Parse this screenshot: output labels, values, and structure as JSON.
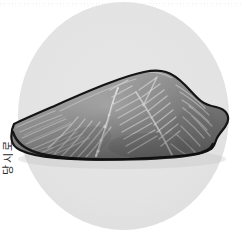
{
  "page": {
    "background_color": "#ffffff",
    "width": 243,
    "height": 238
  },
  "top_rule": {
    "style": "dotted",
    "color": "#ededed"
  },
  "plate": {
    "shape": "circle",
    "color": "#e3e3e3",
    "label": "circular light gray backdrop"
  },
  "margin_caption": {
    "text": "당시로",
    "orientation": "rotated-90",
    "color": "#2b2b2b"
  },
  "illustration": {
    "subject": "fish-fillet",
    "title": "생선 필레",
    "style": "grayscale pencil illustration",
    "outline_color": "#141414",
    "flesh_light": "#b4b4b4",
    "flesh_mid": "#8d8d8d",
    "flesh_dark": "#5e5e5e",
    "fiber_color": "#d8d8d8",
    "features": [
      "chevron muscle fiber bands",
      "central lateral bloodline seam",
      "dark skin outline along lower edge",
      "tapered pointed left tail end",
      "rounded thick right shoulder"
    ]
  }
}
